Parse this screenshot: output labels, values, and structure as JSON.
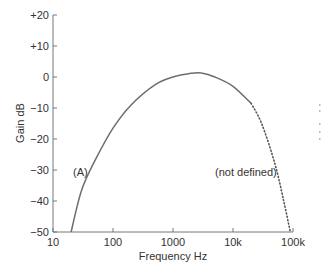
{
  "chart_data": {
    "type": "line",
    "title": "",
    "xlabel": "Frequency Hz",
    "ylabel": "Gain dB",
    "xscale": "log",
    "xlim": [
      10,
      100000
    ],
    "ylim": [
      -50,
      20
    ],
    "grid": false,
    "legend": null,
    "x_ticks": [
      {
        "value": 10,
        "label": "10"
      },
      {
        "value": 100,
        "label": "100"
      },
      {
        "value": 1000,
        "label": "1000"
      },
      {
        "value": 10000,
        "label": "10k"
      },
      {
        "value": 100000,
        "label": "100k"
      }
    ],
    "y_ticks": [
      {
        "value": 20,
        "label": "+20"
      },
      {
        "value": 10,
        "label": "+10"
      },
      {
        "value": 0,
        "label": "0"
      },
      {
        "value": -10,
        "label": "−10"
      },
      {
        "value": -20,
        "label": "−20"
      },
      {
        "value": -30,
        "label": "−30"
      },
      {
        "value": -40,
        "label": "−40"
      },
      {
        "value": -50,
        "label": "−50"
      }
    ],
    "series": [
      {
        "name": "(A)",
        "style": "solid",
        "color": "#6e6e6e",
        "x": [
          20,
          30,
          50,
          100,
          200,
          500,
          1000,
          2000,
          3000,
          5000,
          10000,
          20000
        ],
        "y": [
          -50,
          -36.5,
          -27,
          -16.5,
          -9,
          -2.5,
          0,
          1.2,
          1.3,
          0,
          -3,
          -8.5
        ]
      },
      {
        "name": "(not defined)",
        "style": "dotted",
        "color": "#555555",
        "x": [
          20000,
          30000,
          50000,
          70000,
          90000
        ],
        "y": [
          -8.5,
          -15,
          -28,
          -40,
          -50
        ]
      }
    ],
    "annotations": [
      {
        "text": "(A)",
        "x": 35,
        "y": -31
      },
      {
        "text": "(not defined)",
        "x": 20000,
        "y": -31
      }
    ]
  }
}
